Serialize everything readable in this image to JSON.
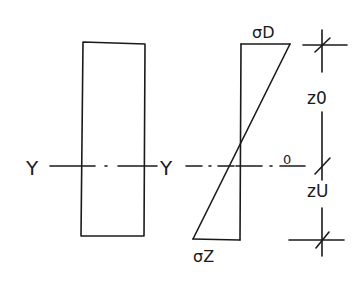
{
  "diagram": {
    "type": "bending stress distribution (hand sketch)",
    "cross_section": {
      "shape": "rectangle"
    },
    "axis": {
      "left_label": "Y",
      "right_label": "Y"
    },
    "stress_diagram": {
      "top_label": "σD",
      "bottom_label": "σZ",
      "zero_label": "0"
    },
    "dimensions": {
      "upper_label": "z0",
      "lower_label": "zU"
    },
    "colors": {
      "ink": "#1a1a1a",
      "background": "#ffffff"
    }
  }
}
